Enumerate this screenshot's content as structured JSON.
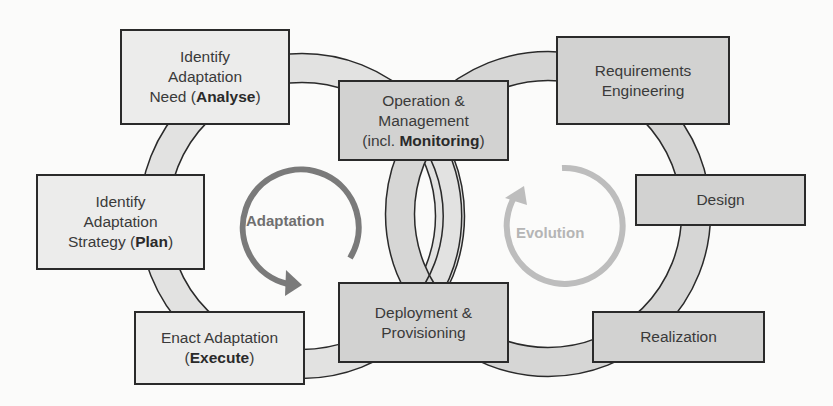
{
  "diagram": {
    "colors": {
      "background": "#fbfbfa",
      "box_light": "#ececeb",
      "box_dark": "#d2d2d1",
      "box_border": "#2a2a2a",
      "ring_fill": "#dcdcdb",
      "ring_overlap": "#c8c8c7",
      "adaptation_arrow": "#7a7a7a",
      "evolution_arrow": "#bdbdbd"
    },
    "cycles": {
      "adaptation": {
        "label": "Adaptation"
      },
      "evolution": {
        "label": "Evolution"
      }
    },
    "boxes": {
      "analyse": {
        "line1": "Identify",
        "line2": "Adaptation",
        "line3_prefix": "Need (",
        "line3_bold": "Analyse",
        "line3_suffix": ")"
      },
      "plan": {
        "line1": "Identify",
        "line2": "Adaptation",
        "line3_prefix": "Strategy (",
        "line3_bold": "Plan",
        "line3_suffix": ")"
      },
      "execute": {
        "line1": "Enact Adaptation",
        "line2_prefix": "(",
        "line2_bold": "Execute",
        "line2_suffix": ")"
      },
      "operation": {
        "line1": "Operation &",
        "line2": "Management",
        "line3_prefix": "(incl. ",
        "line3_bold": "Monitoring",
        "line3_suffix": ")"
      },
      "deployment": {
        "line1": "Deployment &",
        "line2": "Provisioning"
      },
      "requirements": {
        "line1": "Requirements",
        "line2": "Engineering"
      },
      "design": {
        "line1": "Design"
      },
      "realization": {
        "line1": "Realization"
      }
    }
  }
}
